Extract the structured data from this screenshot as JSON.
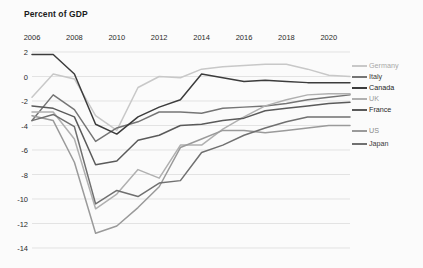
{
  "chart_data": {
    "type": "line",
    "title": "Percent of GDP",
    "xlabel": "",
    "ylabel": "",
    "grid": true,
    "legend_position": "right",
    "xlim": [
      2006,
      2021
    ],
    "ylim": [
      -14,
      2
    ],
    "x": [
      2006,
      2007,
      2008,
      2009,
      2010,
      2011,
      2012,
      2013,
      2014,
      2015,
      2016,
      2017,
      2018,
      2019,
      2020,
      2021
    ],
    "xticks": [
      2006,
      2008,
      2010,
      2012,
      2014,
      2016,
      2018,
      2020
    ],
    "yticks": [
      2,
      0,
      -2,
      -4,
      -6,
      -8,
      -10,
      -12,
      -14
    ],
    "series": [
      {
        "name": "Germany",
        "color": "#c8c8c8",
        "values": [
          -1.7,
          0.2,
          -0.2,
          -3.2,
          -4.4,
          -0.9,
          0.0,
          -0.1,
          0.6,
          0.8,
          0.9,
          1.0,
          1.0,
          0.6,
          0.1,
          0.0
        ]
      },
      {
        "name": "Italy",
        "color": "#757575",
        "values": [
          -3.6,
          -1.5,
          -2.7,
          -5.3,
          -4.2,
          -3.7,
          -2.9,
          -2.9,
          -3.0,
          -2.6,
          -2.5,
          -2.4,
          -2.2,
          -1.9,
          -1.7,
          -1.5
        ]
      },
      {
        "name": "Canada",
        "color": "#3c3c3c",
        "values": [
          1.8,
          1.8,
          0.2,
          -3.9,
          -4.7,
          -3.3,
          -2.5,
          -1.9,
          0.2,
          -0.1,
          -0.4,
          -0.3,
          -0.4,
          -0.5,
          -0.5,
          -0.5
        ]
      },
      {
        "name": "UK",
        "color": "#b0b0b0",
        "values": [
          -2.9,
          -2.9,
          -5.1,
          -10.8,
          -9.6,
          -7.6,
          -8.3,
          -5.6,
          -5.6,
          -4.3,
          -3.3,
          -2.4,
          -1.9,
          -1.5,
          -1.4,
          -1.4
        ]
      },
      {
        "name": "France",
        "color": "#5a5a5a",
        "values": [
          -2.4,
          -2.6,
          -3.3,
          -7.2,
          -6.9,
          -5.2,
          -4.8,
          -4.0,
          -3.9,
          -3.6,
          -3.4,
          -2.8,
          -2.6,
          -2.4,
          -2.2,
          -2.1
        ]
      },
      {
        "name": "US",
        "color": "#9a9a9a",
        "values": [
          -3.2,
          -3.6,
          -7.0,
          -12.8,
          -12.2,
          -10.7,
          -9.0,
          -5.8,
          -5.1,
          -4.4,
          -4.4,
          -4.6,
          -4.4,
          -4.2,
          -4.0,
          -4.0
        ]
      },
      {
        "name": "Japan",
        "color": "#707070",
        "values": [
          -3.6,
          -3.1,
          -4.1,
          -10.4,
          -9.3,
          -9.8,
          -8.7,
          -8.5,
          -6.2,
          -5.6,
          -4.8,
          -4.2,
          -3.7,
          -3.3,
          -3.3,
          -3.3
        ]
      }
    ]
  },
  "legend": {
    "items": [
      {
        "label": "Germany",
        "color": "#c8c8c8",
        "text_color": "#a8a8a8"
      },
      {
        "label": "Italy",
        "color": "#757575",
        "text_color": "#3a3a3a"
      },
      {
        "label": "Canada",
        "color": "#3c3c3c",
        "text_color": "#1b1b1b"
      },
      {
        "label": "UK",
        "color": "#b0b0b0",
        "text_color": "#9a9a9a"
      },
      {
        "label": "France",
        "color": "#5a5a5a",
        "text_color": "#2a2a2a"
      },
      {
        "label": "US",
        "color": "#9a9a9a",
        "text_color": "#8a8a8a"
      },
      {
        "label": "Japan",
        "color": "#707070",
        "text_color": "#3a3a3a"
      }
    ]
  }
}
